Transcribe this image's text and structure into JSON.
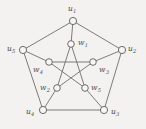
{
  "figure": {
    "name": "petersen-graph",
    "caption": "",
    "background_color": "#f3f2f0",
    "edge_color": "#6e6e6e",
    "vertex_fill": "#f7f6f4",
    "vertex_stroke": "#5c5c5c",
    "label_color": "#4a4a4a"
  },
  "graph_data": {
    "type": "graph",
    "name": "Petersen graph",
    "vertex_count": 10,
    "edge_count": 15,
    "outer_cycle": [
      "u1",
      "u2",
      "u3",
      "u4",
      "u5"
    ],
    "inner_pentagram": [
      "w1",
      "w2",
      "w3",
      "w4",
      "w5"
    ],
    "vertices": [
      {
        "id": "u1",
        "label": "u",
        "sub": "1",
        "x": 73,
        "y": 21,
        "r": 3.6,
        "label_x": 68,
        "label_y": 5,
        "group": "outer"
      },
      {
        "id": "u2",
        "label": "u",
        "sub": "2",
        "x": 122,
        "y": 50,
        "r": 3.6,
        "label_x": 128,
        "label_y": 45,
        "group": "outer"
      },
      {
        "id": "u3",
        "label": "u",
        "sub": "3",
        "x": 104,
        "y": 110,
        "r": 3.6,
        "label_x": 111,
        "label_y": 108,
        "group": "outer"
      },
      {
        "id": "u4",
        "label": "u",
        "sub": "4",
        "x": 43,
        "y": 110,
        "r": 3.6,
        "label_x": 26,
        "label_y": 108,
        "group": "outer"
      },
      {
        "id": "u5",
        "label": "u",
        "sub": "5",
        "x": 23,
        "y": 50,
        "r": 3.6,
        "label_x": 7,
        "label_y": 45,
        "group": "outer"
      },
      {
        "id": "w1",
        "label": "w",
        "sub": "1",
        "x": 71,
        "y": 44,
        "r": 3.3,
        "label_x": 78,
        "label_y": 39,
        "group": "inner"
      },
      {
        "id": "w2",
        "label": "w",
        "sub": "2",
        "x": 57,
        "y": 88,
        "r": 3.3,
        "label_x": 40,
        "label_y": 84,
        "group": "inner"
      },
      {
        "id": "w3",
        "label": "w",
        "sub": "3",
        "x": 93,
        "y": 62,
        "r": 3.3,
        "label_x": 99,
        "label_y": 66,
        "group": "inner"
      },
      {
        "id": "w4",
        "label": "w",
        "sub": "4",
        "x": 49,
        "y": 62,
        "r": 3.3,
        "label_x": 33,
        "label_y": 66,
        "group": "inner"
      },
      {
        "id": "w5",
        "label": "w",
        "sub": "5",
        "x": 85,
        "y": 88,
        "r": 3.3,
        "label_x": 91,
        "label_y": 84,
        "group": "inner"
      }
    ],
    "edges": [
      {
        "from": "u1",
        "to": "u2",
        "kind": "outer"
      },
      {
        "from": "u2",
        "to": "u3",
        "kind": "outer"
      },
      {
        "from": "u3",
        "to": "u4",
        "kind": "outer"
      },
      {
        "from": "u4",
        "to": "u5",
        "kind": "outer"
      },
      {
        "from": "u5",
        "to": "u1",
        "kind": "outer"
      },
      {
        "from": "u1",
        "to": "w1",
        "kind": "spoke"
      },
      {
        "from": "u2",
        "to": "w3",
        "kind": "spoke"
      },
      {
        "from": "u3",
        "to": "w5",
        "kind": "spoke"
      },
      {
        "from": "u4",
        "to": "w2",
        "kind": "spoke"
      },
      {
        "from": "u5",
        "to": "w4",
        "kind": "spoke"
      },
      {
        "from": "w1",
        "to": "w2",
        "kind": "inner"
      },
      {
        "from": "w2",
        "to": "w3",
        "kind": "inner"
      },
      {
        "from": "w3",
        "to": "w4",
        "kind": "inner"
      },
      {
        "from": "w4",
        "to": "w5",
        "kind": "inner"
      },
      {
        "from": "w5",
        "to": "w1",
        "kind": "inner"
      }
    ]
  }
}
